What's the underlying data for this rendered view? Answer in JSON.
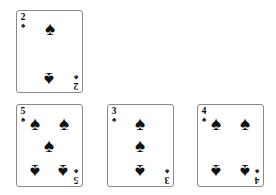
{
  "table": {
    "background": "#ffffff"
  },
  "cards": [
    {
      "rank": "2",
      "suit": "♠",
      "suit_name": "spades",
      "position": "top-row-left",
      "pips": [
        {
          "x": 33,
          "y": 18,
          "inverted": false
        },
        {
          "x": 32,
          "y": 68,
          "inverted": true
        }
      ]
    },
    {
      "rank": "5",
      "suit": "♠",
      "suit_name": "spades",
      "position": "bottom-row-left",
      "pips": [
        {
          "x": 18,
          "y": 19,
          "inverted": false
        },
        {
          "x": 47,
          "y": 19,
          "inverted": false
        },
        {
          "x": 32,
          "y": 41,
          "inverted": false
        },
        {
          "x": 18,
          "y": 66,
          "inverted": true
        },
        {
          "x": 46,
          "y": 66,
          "inverted": true
        }
      ]
    },
    {
      "rank": "3",
      "suit": "♠",
      "suit_name": "spades",
      "position": "bottom-row-middle",
      "pips": [
        {
          "x": 32,
          "y": 19,
          "inverted": false
        },
        {
          "x": 32,
          "y": 41,
          "inverted": false
        },
        {
          "x": 32,
          "y": 66,
          "inverted": true
        }
      ]
    },
    {
      "rank": "4",
      "suit": "♠",
      "suit_name": "spades",
      "position": "bottom-row-right",
      "pips": [
        {
          "x": 18,
          "y": 19,
          "inverted": false
        },
        {
          "x": 47,
          "y": 19,
          "inverted": false
        },
        {
          "x": 18,
          "y": 66,
          "inverted": true
        },
        {
          "x": 47,
          "y": 66,
          "inverted": true
        }
      ]
    }
  ]
}
